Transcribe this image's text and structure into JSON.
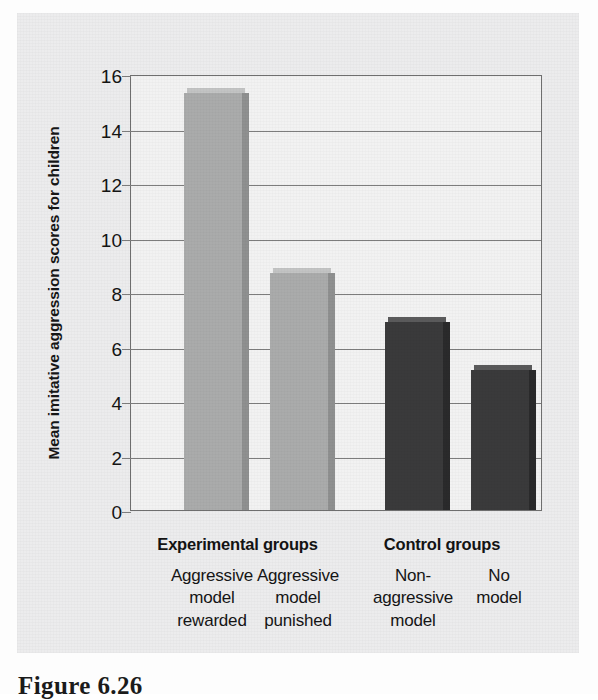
{
  "figure": {
    "caption": "Figure 6.26",
    "panel_bg_color": "#ececed",
    "plot_bg_color": "#f2f2f2",
    "axis_line_color": "#6f6f6f"
  },
  "chart_data": {
    "type": "bar",
    "title": "",
    "subtitle": "",
    "xlabel": "",
    "ylabel": "Mean imitative aggression scores for children",
    "ylim": [
      0,
      16
    ],
    "ytick_labels": [
      "0",
      "2",
      "4",
      "6",
      "8",
      "10",
      "12",
      "14",
      "16"
    ],
    "ytick_values": [
      0,
      2,
      4,
      6,
      8,
      10,
      12,
      14,
      16
    ],
    "grid": true,
    "legend": "none",
    "categories": [
      "Aggressive model rewarded",
      "Aggressive model punished",
      "Non-aggressive model",
      "No model"
    ],
    "values": [
      15.3,
      8.7,
      6.9,
      5.15
    ],
    "bar_colors": [
      "#aaabab",
      "#aaabab",
      "#3a3a3b",
      "#3a3a3b"
    ],
    "groups": [
      {
        "label": "Experimental groups",
        "members": [
          0,
          1
        ]
      },
      {
        "label": "Control groups",
        "members": [
          2,
          3
        ]
      }
    ]
  },
  "axis": {
    "y_title": "Mean imitative aggression scores for children",
    "ticks": [
      {
        "value": 16,
        "label": "16"
      },
      {
        "value": 14,
        "label": "14"
      },
      {
        "value": 12,
        "label": "12"
      },
      {
        "value": 10,
        "label": "10"
      },
      {
        "value": 8,
        "label": "8"
      },
      {
        "value": 6,
        "label": "6"
      },
      {
        "value": 4,
        "label": "4"
      },
      {
        "value": 2,
        "label": "2"
      },
      {
        "value": 0,
        "label": "0"
      }
    ]
  },
  "bars": [
    {
      "id": "aggressive-model-rewarded",
      "value": 15.3,
      "shade": "light",
      "label_lines": [
        "Aggressive",
        "model",
        "rewarded"
      ]
    },
    {
      "id": "aggressive-model-punished",
      "value": 8.7,
      "shade": "light",
      "label_lines": [
        "Aggressive",
        "model",
        "punished"
      ]
    },
    {
      "id": "non-aggressive-model",
      "value": 6.9,
      "shade": "dark",
      "label_lines": [
        "Non-",
        "aggressive",
        "model"
      ]
    },
    {
      "id": "no-model",
      "value": 5.15,
      "shade": "dark",
      "label_lines": [
        "No",
        "model"
      ]
    }
  ],
  "group_headers": [
    {
      "id": "experimental",
      "label": "Experimental groups"
    },
    {
      "id": "control",
      "label": "Control groups"
    }
  ]
}
